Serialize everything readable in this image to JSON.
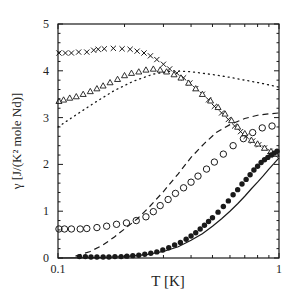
{
  "chart_data": {
    "type": "scatter",
    "title": "",
    "xlabel": "T [K]",
    "ylabel": "γ [J/(K² mole Nd)]",
    "xscale": "log",
    "xlim": [
      0.1,
      1
    ],
    "ylim": [
      0,
      5
    ],
    "xticks": [
      {
        "v": 0.1,
        "label": "0.1"
      },
      {
        "v": 1,
        "label": "1"
      }
    ],
    "yticks": [
      {
        "v": 0,
        "label": "0"
      },
      {
        "v": 1,
        "label": "1"
      },
      {
        "v": 2,
        "label": "2"
      },
      {
        "v": 3,
        "label": "3"
      },
      {
        "v": 4,
        "label": "4"
      },
      {
        "v": 5,
        "label": "5"
      }
    ],
    "grid": false,
    "legend": null,
    "series": [
      {
        "name": "crosses",
        "marker": "x",
        "line": "none",
        "x": [
          0.101,
          0.108,
          0.115,
          0.124,
          0.135,
          0.145,
          0.152,
          0.162,
          0.178,
          0.195,
          0.212,
          0.228,
          0.245,
          0.262,
          0.28,
          0.3,
          0.32,
          0.345,
          0.37,
          0.395,
          0.42,
          0.45,
          0.48,
          0.51,
          0.55,
          0.59,
          0.63,
          0.67,
          0.71,
          0.76,
          0.81,
          0.86,
          0.91,
          0.96
        ],
        "y": [
          4.38,
          4.38,
          4.38,
          4.4,
          4.4,
          4.44,
          4.46,
          4.47,
          4.48,
          4.47,
          4.46,
          4.42,
          4.38,
          4.32,
          4.24,
          4.14,
          4.04,
          3.95,
          3.85,
          3.74,
          3.62,
          3.5,
          3.38,
          3.24,
          3.1,
          2.96,
          2.82,
          2.7,
          2.6,
          2.5,
          2.42,
          2.35,
          2.28,
          2.2
        ]
      },
      {
        "name": "triangles",
        "marker": "triangle",
        "line": "none",
        "x": [
          0.101,
          0.106,
          0.113,
          0.121,
          0.13,
          0.14,
          0.15,
          0.16,
          0.172,
          0.186,
          0.2,
          0.215,
          0.232,
          0.25,
          0.27,
          0.29,
          0.31,
          0.335,
          0.36,
          0.39,
          0.42,
          0.45,
          0.49,
          0.53,
          0.57,
          0.61,
          0.65,
          0.7,
          0.75,
          0.8,
          0.86,
          0.92,
          0.97
        ],
        "y": [
          3.35,
          3.38,
          3.42,
          3.45,
          3.5,
          3.56,
          3.62,
          3.68,
          3.75,
          3.82,
          3.9,
          3.95,
          3.98,
          4.02,
          4.04,
          4.02,
          3.98,
          3.92,
          3.85,
          3.74,
          3.62,
          3.5,
          3.36,
          3.22,
          3.08,
          2.94,
          2.8,
          2.66,
          2.52,
          2.44,
          2.35,
          2.28,
          2.22
        ]
      },
      {
        "name": "dotted-curve",
        "marker": "none",
        "line": "dotted",
        "x": [
          0.1,
          0.12,
          0.15,
          0.18,
          0.22,
          0.27,
          0.33,
          0.4,
          0.5,
          0.6,
          0.7,
          0.8,
          0.9,
          1.0
        ],
        "y": [
          2.8,
          3.05,
          3.35,
          3.58,
          3.78,
          3.93,
          4.0,
          3.98,
          3.92,
          3.86,
          3.8,
          3.75,
          3.7,
          3.65
        ]
      },
      {
        "name": "open-circles",
        "marker": "circle-open",
        "line": "none",
        "x": [
          0.101,
          0.107,
          0.115,
          0.126,
          0.135,
          0.15,
          0.166,
          0.184,
          0.204,
          0.226,
          0.25,
          0.27,
          0.29,
          0.315,
          0.34,
          0.37,
          0.4,
          0.43,
          0.47,
          0.51,
          0.56,
          0.62,
          0.69,
          0.76,
          0.84,
          0.93
        ],
        "y": [
          0.62,
          0.62,
          0.62,
          0.62,
          0.63,
          0.65,
          0.68,
          0.72,
          0.75,
          0.8,
          0.88,
          0.99,
          1.12,
          1.25,
          1.38,
          1.5,
          1.62,
          1.75,
          1.9,
          2.05,
          2.22,
          2.4,
          2.55,
          2.68,
          2.78,
          2.82
        ]
      },
      {
        "name": "dashed-curve",
        "marker": "none",
        "line": "dashed",
        "x": [
          0.12,
          0.14,
          0.16,
          0.18,
          0.2,
          0.23,
          0.26,
          0.3,
          0.35,
          0.4,
          0.46,
          0.52,
          0.6,
          0.7,
          0.8,
          0.9,
          1.0
        ],
        "y": [
          0.04,
          0.14,
          0.28,
          0.45,
          0.62,
          0.85,
          1.1,
          1.42,
          1.8,
          2.15,
          2.45,
          2.68,
          2.85,
          2.98,
          3.05,
          3.08,
          3.1
        ]
      },
      {
        "name": "filled-circles",
        "marker": "circle-filled",
        "line": "none",
        "x": [
          0.125,
          0.133,
          0.141,
          0.15,
          0.16,
          0.17,
          0.181,
          0.193,
          0.205,
          0.218,
          0.232,
          0.247,
          0.263,
          0.28,
          0.298,
          0.317,
          0.337,
          0.358,
          0.38,
          0.4,
          0.42,
          0.44,
          0.46,
          0.48,
          0.5,
          0.53,
          0.56,
          0.59,
          0.62,
          0.65,
          0.68,
          0.71,
          0.74,
          0.77,
          0.8,
          0.83,
          0.86,
          0.89,
          0.92,
          0.95,
          0.98
        ],
        "y": [
          0.03,
          0.03,
          0.02,
          0.02,
          0.02,
          0.02,
          0.03,
          0.03,
          0.04,
          0.05,
          0.06,
          0.08,
          0.1,
          0.13,
          0.17,
          0.22,
          0.28,
          0.33,
          0.4,
          0.47,
          0.54,
          0.62,
          0.7,
          0.78,
          0.86,
          0.98,
          1.1,
          1.22,
          1.35,
          1.46,
          1.58,
          1.68,
          1.78,
          1.88,
          1.96,
          2.04,
          2.1,
          2.15,
          2.2,
          2.24,
          2.28
        ]
      },
      {
        "name": "solid-curve",
        "marker": "none",
        "line": "solid",
        "x": [
          0.1,
          0.15,
          0.2,
          0.25,
          0.3,
          0.35,
          0.4,
          0.45,
          0.5,
          0.55,
          0.6,
          0.65,
          0.7,
          0.75,
          0.8,
          0.85,
          0.9,
          0.95,
          1.0
        ],
        "y": [
          0.0,
          0.01,
          0.03,
          0.07,
          0.14,
          0.24,
          0.38,
          0.52,
          0.68,
          0.84,
          1.0,
          1.16,
          1.32,
          1.48,
          1.62,
          1.76,
          1.9,
          2.02,
          2.14
        ]
      }
    ]
  },
  "layout": {
    "frame": {
      "left": 58,
      "top": 24,
      "right": 279,
      "bottom": 258
    },
    "colors": {
      "ink": "#1a1a1a",
      "background": "#ffffff"
    }
  }
}
